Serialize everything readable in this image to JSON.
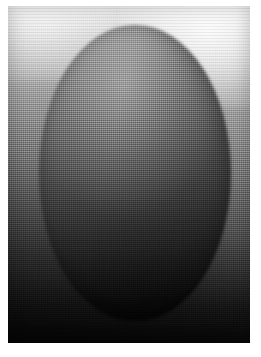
{
  "page": {
    "background_color": "#ffffff",
    "width": 261,
    "height": 357,
    "caption": ""
  },
  "photo": {
    "kind": "halftone-grayscale-photograph",
    "subject_name": "ellipsoid-egg-form",
    "alt_text": "Grayscale halftone photograph of a large egg-shaped ellipsoid against a gradient backdrop, lit from above so the top is pale gray and the bottom falls off to near black.",
    "orientation": "portrait",
    "margins": {
      "left": 8,
      "top": 6,
      "right": 11,
      "bottom": 14
    },
    "plate": {
      "width": 242,
      "height": 337
    },
    "texture": {
      "type": "halftone-dither",
      "screen_pitch_px": 2,
      "grain": "offset-dot-lattice"
    }
  },
  "tones": {
    "background_top": "#f2f2f2",
    "background_mid": "#949494",
    "background_bottom": "#0b0b0b",
    "subject_top": "#8e8e8e",
    "subject_mid": "#4f4f4f",
    "subject_bottom": "#050505",
    "highlight": "#ffffff",
    "shadow": "#000000"
  },
  "subject_geometry": {
    "shape": "ellipse",
    "center_x_pct": 52.5,
    "center_y_pct": 49.5,
    "width_pct": 79,
    "height_pct": 88
  },
  "lighting": {
    "key_light_direction": "top / upper-left",
    "specular_glow_position": "upper-right backdrop",
    "falloff": "vertical, light to dark"
  }
}
